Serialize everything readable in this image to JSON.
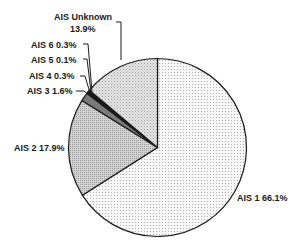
{
  "chart_data": {
    "type": "pie",
    "title": "",
    "start_angle": "12 o'clock",
    "direction": "clockwise",
    "slices": [
      {
        "label": "AIS 1",
        "value": 66.1,
        "display": "AIS 1  66.1%",
        "fill": "#f2f2f2",
        "pattern": "fine-dots"
      },
      {
        "label": "AIS 2",
        "value": 17.9,
        "display": "AIS 2  17.9%",
        "fill": "#c8c8c8",
        "pattern": "dense-dots"
      },
      {
        "label": "AIS 3",
        "value": 1.6,
        "display": "AIS 3  1.6%",
        "fill": "#7a7a7a",
        "pattern": "solid"
      },
      {
        "label": "AIS 4",
        "value": 0.3,
        "display": "AIS 4  0.3%",
        "fill": "#111111",
        "pattern": "solid"
      },
      {
        "label": "AIS 5",
        "value": 0.1,
        "display": "AIS 5  0.1%",
        "fill": "#555555",
        "pattern": "solid"
      },
      {
        "label": "AIS 6",
        "value": 0.3,
        "display": "AIS 6  0.3%",
        "fill": "#222222",
        "pattern": "solid"
      },
      {
        "label": "AIS Unknown",
        "value": 13.9,
        "display": "AIS Unknown 13.9%",
        "fill": "#d9d9d9",
        "pattern": "medium-dots"
      }
    ],
    "labels": {
      "ais1": "AIS 1  66.1%",
      "ais2": "AIS 2  17.9%",
      "ais3": "AIS 3  1.6%",
      "ais4": "AIS 4  0.3%",
      "ais5": "AIS 5  0.1%",
      "ais6": "AIS 6  0.3%",
      "unknown_line1": "AIS Unknown",
      "unknown_line2": "13.9%"
    },
    "legend": "none (direct labels with leader lines)"
  }
}
